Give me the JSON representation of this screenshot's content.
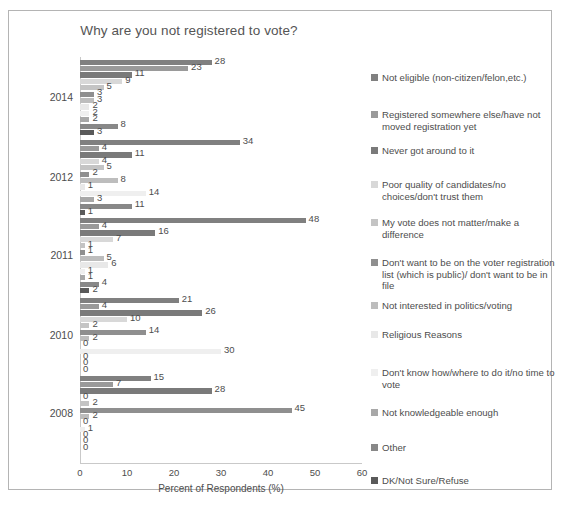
{
  "chart_data": {
    "type": "bar",
    "orientation": "horizontal",
    "title": "Why are you not registered to vote?",
    "xlabel": "Percent of Respondents (%)",
    "ylabel": "",
    "xlim": [
      0,
      60
    ],
    "xticks": [
      "0",
      "10",
      "20",
      "30",
      "40",
      "50",
      "60"
    ],
    "grid": false,
    "legend_position": "right",
    "categories": [
      "2014",
      "2012",
      "2011",
      "2010",
      "2008"
    ],
    "series": [
      {
        "name": "Not eligible (non-citizen/felon,etc.)",
        "color": "#808080",
        "values": [
          28,
          34,
          48,
          21,
          15
        ]
      },
      {
        "name": "Registered somewhere else/have not moved registration yet",
        "color": "#9a9a9a",
        "values": [
          23,
          4,
          4,
          4,
          7
        ]
      },
      {
        "name": "Never got around to it",
        "color": "#7a7a7a",
        "values": [
          11,
          11,
          16,
          26,
          28
        ]
      },
      {
        "name": "Poor quality of candidates/no choices/don't trust them",
        "color": "#d8d8d8",
        "values": [
          9,
          4,
          7,
          10,
          0
        ]
      },
      {
        "name": "My vote does not matter/make a difference",
        "color": "#c4c4c4",
        "values": [
          5,
          5,
          1,
          2,
          2
        ]
      },
      {
        "name": "Don't want to be on the voter registration list (which is public)/ don't want to be in file",
        "color": "#8f8f8f",
        "values": [
          3,
          2,
          1,
          14,
          45
        ]
      },
      {
        "name": "Not interested in politics/voting",
        "color": "#bdbdbd",
        "values": [
          3,
          8,
          5,
          2,
          2
        ]
      },
      {
        "name": "Religious Reasons",
        "color": "#e8e8e8",
        "values": [
          2,
          1,
          6,
          0,
          0
        ]
      },
      {
        "name": "Don't know how/where to do it/no time to vote",
        "color": "#efefef",
        "values": [
          2,
          14,
          1,
          30,
          1
        ]
      },
      {
        "name": "Not knowledgeable enough",
        "color": "#a8a8a8",
        "values": [
          2,
          3,
          1,
          0,
          0
        ]
      },
      {
        "name": "Other",
        "color": "#888888",
        "values": [
          8,
          11,
          4,
          0,
          0
        ]
      },
      {
        "name": "DK/Not Sure/Refuse",
        "color": "#5a5a5a",
        "values": [
          3,
          1,
          2,
          0,
          0
        ]
      }
    ]
  },
  "legend": {
    "items": [
      {
        "label": "Not eligible (non-citizen/felon,etc.)",
        "color": "#808080"
      },
      {
        "label": "Registered somewhere else/have not moved registration yet",
        "color": "#9a9a9a"
      },
      {
        "label": "Never got around to it",
        "color": "#7a7a7a"
      },
      {
        "label": "Poor quality of candidates/no choices/don't trust them",
        "color": "#d8d8d8"
      },
      {
        "label": "My vote does not matter/make a difference",
        "color": "#c4c4c4"
      },
      {
        "label": "Don't want to be on the voter registration list (which is public)/ don't want to be in file",
        "color": "#8f8f8f"
      },
      {
        "label": "Not interested in politics/voting",
        "color": "#bdbdbd"
      },
      {
        "label": "Religious Reasons",
        "color": "#e8e8e8"
      },
      {
        "label": "Don't know how/where to do it/no time to vote",
        "color": "#efefef"
      },
      {
        "label": "Not knowledgeable enough",
        "color": "#a8a8a8"
      },
      {
        "label": "Other",
        "color": "#888888"
      },
      {
        "label": "DK/Not Sure/Refuse",
        "color": "#5a5a5a"
      }
    ]
  }
}
